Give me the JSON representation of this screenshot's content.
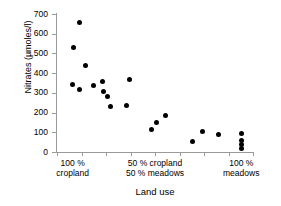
{
  "chart_data": {
    "type": "scatter",
    "title": "",
    "xlabel": "Land use",
    "ylabel": "Nitrates (µmoles/l)",
    "ylim": [
      0,
      700
    ],
    "ytick_labels": [
      "700",
      "600",
      "500",
      "400",
      "300",
      "200",
      "100",
      "0"
    ],
    "ytick_values": [
      700,
      600,
      500,
      400,
      300,
      200,
      100,
      0
    ],
    "grid": false,
    "legend": null,
    "xlim": [
      0,
      100
    ],
    "x_axis_description": "Land use gradient from 100 % cropland on the left to 100 % meadows on the right",
    "xtick_category_labels": [
      "100 %\ncropland",
      "50 % cropland\n50 % meadows",
      "100 %\nmeadows"
    ],
    "xtick_category_positions": [
      8,
      50,
      94
    ],
    "series": [
      {
        "name": "Nitrate concentration",
        "marker": "filled-circle",
        "color": "#000000",
        "points": [
          {
            "x": 11.5,
            "y": 655
          },
          {
            "x": 8.5,
            "y": 530
          },
          {
            "x": 14.5,
            "y": 437
          },
          {
            "x": 8.0,
            "y": 340
          },
          {
            "x": 11.5,
            "y": 318
          },
          {
            "x": 18.5,
            "y": 338
          },
          {
            "x": 23.0,
            "y": 358
          },
          {
            "x": 23.5,
            "y": 305
          },
          {
            "x": 26.0,
            "y": 281
          },
          {
            "x": 27.5,
            "y": 233
          },
          {
            "x": 37.0,
            "y": 366
          },
          {
            "x": 35.5,
            "y": 236
          },
          {
            "x": 48.0,
            "y": 115
          },
          {
            "x": 51.0,
            "y": 152
          },
          {
            "x": 55.5,
            "y": 183
          },
          {
            "x": 69.0,
            "y": 52
          },
          {
            "x": 74.0,
            "y": 106
          },
          {
            "x": 82.5,
            "y": 90
          },
          {
            "x": 94.0,
            "y": 92
          },
          {
            "x": 94.0,
            "y": 58
          },
          {
            "x": 94.0,
            "y": 40
          },
          {
            "x": 94.0,
            "y": 16
          }
        ]
      }
    ]
  },
  "colors": {
    "marker": "#000000",
    "axis": "#9a9a9a",
    "text": "#000000",
    "background": "#ffffff"
  }
}
